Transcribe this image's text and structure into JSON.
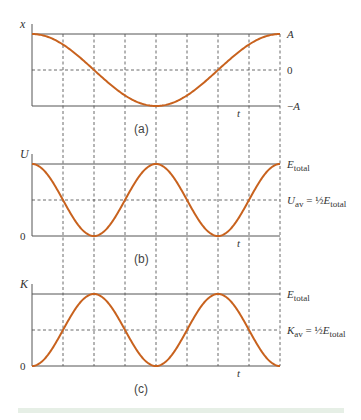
{
  "figure": {
    "panels": [
      {
        "id": "a",
        "caption": "(a)",
        "y_axis_label": "x",
        "x_axis_label": "t",
        "right_labels": [
          {
            "text": "A",
            "level": "top"
          },
          {
            "text": "0",
            "level": "mid"
          },
          {
            "text": "−A",
            "level": "bottom"
          }
        ],
        "left_labels": [],
        "curve": "cosine",
        "curve_description": "x = A cos(ωt), one full period"
      },
      {
        "id": "b",
        "caption": "(b)",
        "y_axis_label": "U",
        "x_axis_label": "t",
        "right_labels": [
          {
            "text": "E",
            "sub": "total",
            "level": "top"
          },
          {
            "text": "U",
            "sub": "av",
            "eq": " = ½ E",
            "sub2": "total",
            "level": "mid"
          }
        ],
        "left_labels": [
          {
            "text": "0",
            "level": "bottom"
          }
        ],
        "curve": "cos_squared",
        "curve_description": "U = E_total cos²(ωt), two humps per period"
      },
      {
        "id": "c",
        "caption": "(c)",
        "y_axis_label": "K",
        "x_axis_label": "t",
        "right_labels": [
          {
            "text": "E",
            "sub": "total",
            "level": "top"
          },
          {
            "text": "K",
            "sub": "av",
            "eq": " = ½ E",
            "sub2": "total",
            "level": "mid"
          }
        ],
        "left_labels": [
          {
            "text": "0",
            "level": "bottom"
          }
        ],
        "curve": "sin_squared",
        "curve_description": "K = E_total sin²(ωt), two humps per period"
      }
    ],
    "colors": {
      "curve": "#c8621e",
      "axis": "#555555",
      "grid": "#444444",
      "footer_strip": "#e6efe6"
    }
  },
  "chart_data": [
    {
      "type": "line",
      "title": "(a)",
      "xlabel": "t",
      "ylabel": "x",
      "x": [
        0,
        0.125,
        0.25,
        0.375,
        0.5,
        0.625,
        0.75,
        0.875,
        1.0
      ],
      "series": [
        {
          "name": "x(t) = A cos(2πt/T)",
          "values": [
            1,
            0.707,
            0,
            -0.707,
            -1,
            -0.707,
            0,
            0.707,
            1
          ]
        }
      ],
      "y_ticks": [
        "−A",
        "0",
        "A"
      ],
      "ylim": [
        -1,
        1
      ],
      "grid": true
    },
    {
      "type": "line",
      "title": "(b)",
      "xlabel": "t",
      "ylabel": "U",
      "x": [
        0,
        0.125,
        0.25,
        0.375,
        0.5,
        0.625,
        0.75,
        0.875,
        1.0
      ],
      "series": [
        {
          "name": "U(t)",
          "values": [
            1,
            0.5,
            0,
            0.5,
            1,
            0.5,
            0,
            0.5,
            1
          ]
        }
      ],
      "y_ticks": [
        "0",
        "U_av = ½ E_total",
        "E_total"
      ],
      "ylim": [
        0,
        1
      ],
      "grid": true
    },
    {
      "type": "line",
      "title": "(c)",
      "xlabel": "t",
      "ylabel": "K",
      "x": [
        0,
        0.125,
        0.25,
        0.375,
        0.5,
        0.625,
        0.75,
        0.875,
        1.0
      ],
      "series": [
        {
          "name": "K(t)",
          "values": [
            0,
            0.5,
            1,
            0.5,
            0,
            0.5,
            1,
            0.5,
            0
          ]
        }
      ],
      "y_ticks": [
        "0",
        "K_av = ½ E_total",
        "E_total"
      ],
      "ylim": [
        0,
        1
      ],
      "grid": true
    }
  ]
}
